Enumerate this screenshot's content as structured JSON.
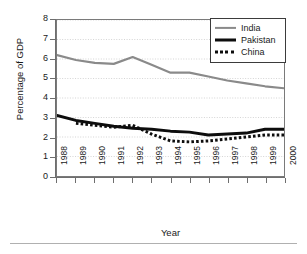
{
  "chart_data": {
    "type": "line",
    "title": "",
    "xlabel": "Year",
    "ylabel": "Percentage of GDP",
    "categories": [
      "1988",
      "1989",
      "1990",
      "1991",
      "1992",
      "1993",
      "1994",
      "1995",
      "1996",
      "1997",
      "1998",
      "1999",
      "2000"
    ],
    "x": [
      1988,
      1989,
      1990,
      1991,
      1992,
      1993,
      1994,
      1995,
      1996,
      1997,
      1998,
      1999,
      2000
    ],
    "ylim": [
      0,
      8
    ],
    "yticks": [
      0,
      1,
      2,
      3,
      4,
      5,
      6,
      7,
      8
    ],
    "ytick_labels": [
      "0",
      "1",
      "2",
      "3",
      "4",
      "5",
      "6",
      "7",
      "8"
    ],
    "grid": true,
    "grid_axis": "y",
    "legend_position": "top-right",
    "series": [
      {
        "name": "India",
        "color": "#8a8a8a",
        "style": "solid",
        "width": 2.2,
        "values": [
          6.2,
          5.95,
          5.8,
          5.75,
          6.1,
          5.7,
          5.3,
          5.3,
          5.1,
          4.9,
          4.75,
          4.6,
          4.5
        ]
      },
      {
        "name": "Pakistan",
        "color": "#0d0d0d",
        "style": "solid",
        "width": 3.0,
        "values": [
          3.1,
          2.85,
          2.7,
          2.55,
          2.45,
          2.4,
          2.3,
          2.25,
          2.1,
          2.15,
          2.2,
          2.4,
          2.4
        ]
      },
      {
        "name": "China",
        "color": "#0d0d0d",
        "style": "dotted",
        "width": 3.0,
        "values": [
          null,
          2.7,
          2.6,
          2.5,
          2.6,
          2.15,
          1.8,
          1.75,
          1.8,
          1.9,
          2.0,
          2.1,
          2.1
        ]
      }
    ]
  },
  "axes": {
    "y_title": "Percentage of GDP",
    "x_title": "Year"
  },
  "legend": {
    "entries": [
      {
        "label": "India",
        "swatch": "india-line-swatch"
      },
      {
        "label": "Pakistan",
        "swatch": "pakistan-line-swatch"
      },
      {
        "label": "China",
        "swatch": "china-dotted-swatch"
      }
    ]
  }
}
